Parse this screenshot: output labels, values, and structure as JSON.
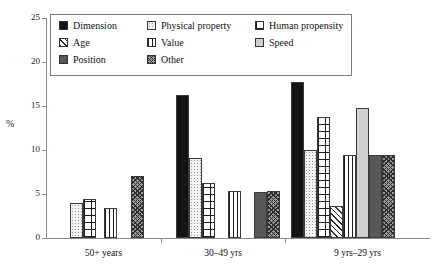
{
  "chart_data": {
    "type": "bar",
    "title": "",
    "xlabel": "",
    "ylabel": "%",
    "ylim": [
      0,
      25
    ],
    "yticks": [
      0,
      5,
      10,
      15,
      20,
      25
    ],
    "grid": false,
    "legend_position": "top-inside",
    "categories": [
      "50+ years",
      "30–49 yrs",
      "9 yrs–29 yrs"
    ],
    "series": [
      {
        "name": "Dimension",
        "values": [
          null,
          16.2,
          17.7
        ]
      },
      {
        "name": "Physical property",
        "values": [
          4.0,
          9.1,
          10.0
        ]
      },
      {
        "name": "Human propensity",
        "values": [
          4.4,
          6.2,
          13.8
        ]
      },
      {
        "name": "Age",
        "values": [
          null,
          null,
          3.6
        ]
      },
      {
        "name": "Value",
        "values": [
          3.4,
          5.3,
          9.4
        ]
      },
      {
        "name": "Speed",
        "values": [
          null,
          null,
          14.8
        ]
      },
      {
        "name": "Position",
        "values": [
          null,
          5.2,
          9.4
        ]
      },
      {
        "name": "Other",
        "values": [
          7.0,
          5.3,
          9.4
        ]
      }
    ],
    "groups": [
      {
        "label": "50+ years",
        "bars": [
          {
            "series": "Physical property",
            "value": 4.0
          },
          {
            "series": "Human propensity",
            "value": 4.4
          },
          {
            "series": "Value",
            "value": 3.4
          },
          {
            "series": "Other",
            "value": 7.0
          }
        ]
      },
      {
        "label": "30–49 yrs",
        "bars": [
          {
            "series": "Dimension",
            "value": 16.2
          },
          {
            "series": "Physical property",
            "value": 9.1
          },
          {
            "series": "Human propensity",
            "value": 6.2
          },
          {
            "series": "Value",
            "value": 5.3
          },
          {
            "series": "Position",
            "value": 5.2
          },
          {
            "series": "Other",
            "value": 5.3
          }
        ]
      },
      {
        "label": "9 yrs–29 yrs",
        "bars": [
          {
            "series": "Dimension",
            "value": 17.7
          },
          {
            "series": "Physical property",
            "value": 10.0
          },
          {
            "series": "Human propensity",
            "value": 13.8
          },
          {
            "series": "Age",
            "value": 3.6
          },
          {
            "series": "Value",
            "value": 9.4
          },
          {
            "series": "Speed",
            "value": 14.8
          },
          {
            "series": "Position",
            "value": 9.4
          },
          {
            "series": "Other",
            "value": 9.4
          }
        ]
      }
    ]
  },
  "legend": {
    "rows": [
      [
        {
          "label": "Dimension",
          "pattern": "dimension"
        },
        {
          "label": "Physical property",
          "pattern": "physical"
        },
        {
          "label": "Human propensity",
          "pattern": "human"
        }
      ],
      [
        {
          "label": "Age",
          "pattern": "age"
        },
        {
          "label": "Value",
          "pattern": "value"
        },
        {
          "label": "Speed",
          "pattern": "speed"
        }
      ],
      [
        {
          "label": "Position",
          "pattern": "position"
        },
        {
          "label": "Other",
          "pattern": "other"
        }
      ]
    ]
  },
  "axis": {
    "y_label": "%",
    "y_ticks": [
      "0",
      "5",
      "10",
      "15",
      "20",
      "25"
    ]
  },
  "colors": {
    "axis": "#8a8a8a",
    "dimension": "#141414",
    "position": "#585858",
    "speed": "#cfcfcf",
    "other": "#9c9c9c",
    "text": "#111111"
  }
}
